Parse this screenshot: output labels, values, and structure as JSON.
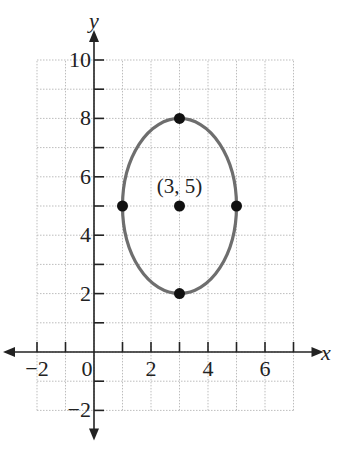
{
  "chart_data": {
    "type": "scatter",
    "title": "",
    "xlabel": "x",
    "ylabel": "y",
    "xlim": [
      -2,
      7
    ],
    "ylim": [
      -2,
      10
    ],
    "grid": true,
    "x_tick_labels": [
      "-2",
      "0",
      "2",
      "4",
      "6"
    ],
    "y_tick_labels": [
      "-2",
      "2",
      "4",
      "6",
      "8",
      "10"
    ],
    "x_ticks": [
      -2,
      -1,
      1,
      2,
      3,
      4,
      5,
      6,
      7
    ],
    "y_ticks": [
      -2,
      -1,
      1,
      2,
      3,
      4,
      5,
      6,
      7,
      8,
      9,
      10
    ],
    "curve": {
      "shape": "ellipse",
      "center": [
        3,
        5
      ],
      "semi_axis_x": 2,
      "semi_axis_y": 3,
      "equation": "(x-3)^2/4 + (y-5)^2/9 = 1",
      "color": "#6e6e6e"
    },
    "points": [
      {
        "x": 3,
        "y": 8
      },
      {
        "x": 3,
        "y": 2
      },
      {
        "x": 1,
        "y": 5
      },
      {
        "x": 5,
        "y": 5
      },
      {
        "x": 3,
        "y": 5
      }
    ],
    "annotations": [
      {
        "text": "(3, 5)",
        "x": 3,
        "y": 5
      }
    ]
  }
}
